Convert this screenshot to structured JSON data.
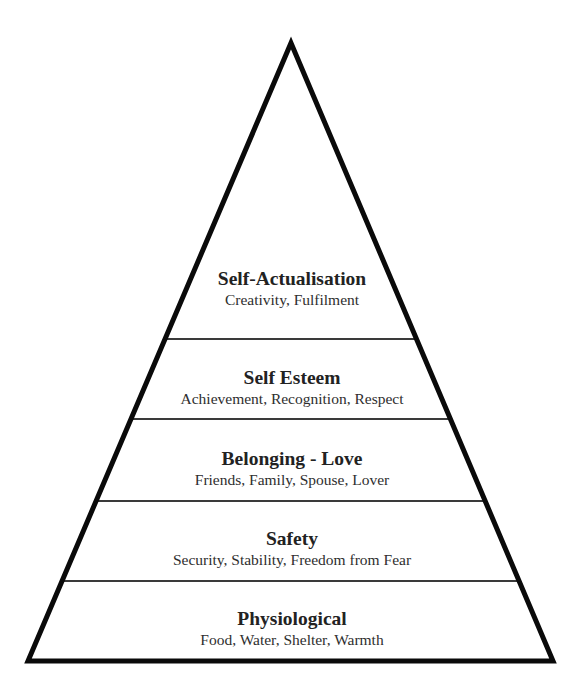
{
  "diagram": {
    "type": "pyramid",
    "orientation": "apex-up",
    "colors": {
      "stroke": "#0a0a0a",
      "divider": "#3a3a3a",
      "fill": "#ffffff",
      "title_text": "#222222",
      "subtitle_text": "#2e2e2e"
    },
    "tiers_top_to_bottom": [
      {
        "level": 5,
        "title": "Self-Actualisation",
        "subtitle": "Creativity, Fulfilment"
      },
      {
        "level": 4,
        "title": "Self Esteem",
        "subtitle": "Achievement, Recognition, Respect"
      },
      {
        "level": 3,
        "title": "Belonging - Love",
        "subtitle": "Friends, Family, Spouse, Lover"
      },
      {
        "level": 2,
        "title": "Safety",
        "subtitle": "Security, Stability, Freedom from Fear"
      },
      {
        "level": 1,
        "title": "Physiological",
        "subtitle": "Food, Water, Shelter, Warmth"
      }
    ]
  }
}
